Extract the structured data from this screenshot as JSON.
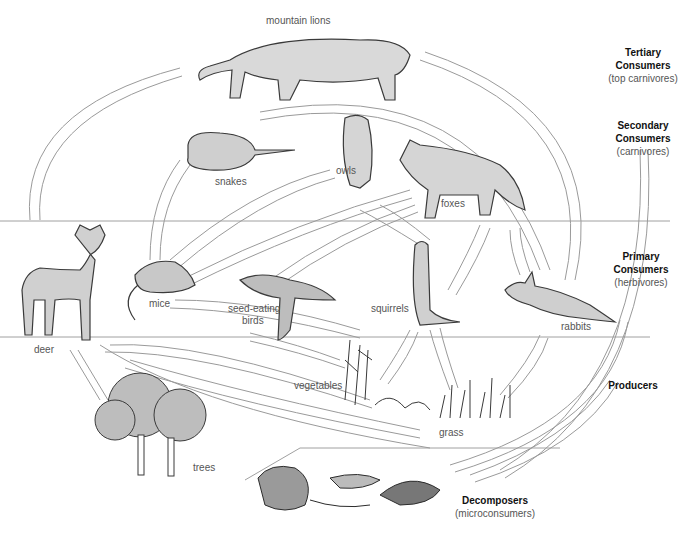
{
  "diagram": {
    "type": "food-web",
    "trophic_levels": [
      {
        "title_line1": "Tertiary",
        "title_line2": "Consumers",
        "subtitle": "(top carnivores)"
      },
      {
        "title_line1": "Secondary",
        "title_line2": "Consumers",
        "subtitle": "(carnivores)"
      },
      {
        "title_line1": "Primary",
        "title_line2": "Consumers",
        "subtitle": "(herbivores)"
      },
      {
        "title_line1": "Producers",
        "title_line2": "",
        "subtitle": ""
      },
      {
        "title_line1": "Decomposers",
        "title_line2": "",
        "subtitle": "(microconsumers)"
      }
    ],
    "organisms": {
      "mountain_lions": "mountain lions",
      "snakes": "snakes",
      "owls": "owls",
      "foxes": "foxes",
      "deer": "deer",
      "mice": "mice",
      "seed_eating_birds_1": "seed-eating",
      "seed_eating_birds_2": "birds",
      "squirrels": "squirrels",
      "rabbits": "rabbits",
      "vegetables": "vegetables",
      "grass": "grass",
      "trees": "trees"
    },
    "colors": {
      "arrow_stroke": "#9a9a9a",
      "divider": "#a0a0a0",
      "illustration": "#3a3a3a"
    }
  }
}
